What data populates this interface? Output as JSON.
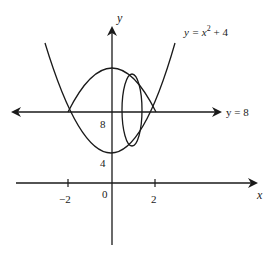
{
  "diagram": {
    "axes": {
      "x_label": "x",
      "y_label": "y",
      "x_ticks": [
        {
          "value": -2,
          "label": "−2"
        },
        {
          "value": 2,
          "label": "2"
        }
      ],
      "origin_label": "0",
      "y_tick_labels": [
        "4",
        "8"
      ]
    },
    "curves": {
      "parabola": {
        "label_prefix": "y = x",
        "label_exp": "2",
        "label_suffix": " + 4",
        "equation": "y = x^2 + 4"
      },
      "line": {
        "label": "y = 8",
        "equation": "y = 8"
      },
      "upper_arc": {
        "description": "cap curve above y = 8 bounded by parabola intersections"
      },
      "cross_section": {
        "shape": "ellipse",
        "description": "vertical elliptical cross-section of solid of revolution"
      }
    },
    "colors": {
      "stroke": "#1a1a1a",
      "background": "#ffffff"
    }
  }
}
